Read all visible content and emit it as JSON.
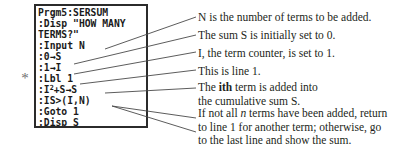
{
  "marker": {
    "symbol": "*"
  },
  "calculator": {
    "label": "ti-calculator-screen",
    "program_lines": [
      "Prgm5:SERSUM",
      ":Disp \"HOW MANY",
      "TERMS?\"",
      ":Input N",
      ":0→S",
      ":1→I",
      ":Lbl 1",
      ":I2+S→S",
      ":IS>(I,N)",
      ":Goto 1",
      ":Disp S"
    ],
    "line_8_base": ":I",
    "line_8_exponent": "2",
    "line_8_rest": "+S→S",
    "border_color": "#2b2b2b",
    "text_color": "#1a1a1a"
  },
  "annotations": [
    {
      "id": "n-terms-note",
      "lines": [
        [
          {
            "text": "N is the number of terms to be added.",
            "style": "normal"
          }
        ]
      ]
    },
    {
      "id": "sum-init-note",
      "lines": [
        [
          {
            "text": "The sum S is initially set to 0.",
            "style": "normal"
          }
        ]
      ]
    },
    {
      "id": "counter-init-note",
      "lines": [
        [
          {
            "text": "I, the term counter, is set to 1.",
            "style": "normal"
          }
        ]
      ]
    },
    {
      "id": "line-one-note",
      "lines": [
        [
          {
            "text": "This is line 1.",
            "style": "normal"
          }
        ]
      ]
    },
    {
      "id": "cumulative-sum-note",
      "lines": [
        [
          {
            "text": "The ",
            "style": "normal"
          },
          {
            "text": "ith",
            "style": "bold"
          },
          {
            "text": " term is added into",
            "style": "normal"
          }
        ],
        [
          {
            "text": "the cumulative sum S.",
            "style": "normal"
          }
        ]
      ]
    },
    {
      "id": "loop-control-note",
      "lines": [
        [
          {
            "text": "If not all ",
            "style": "normal"
          },
          {
            "text": "n",
            "style": "italic"
          },
          {
            "text": " terms have been added, return",
            "style": "normal"
          }
        ],
        [
          {
            "text": "to line 1 for another term; otherwise, go",
            "style": "normal"
          }
        ],
        [
          {
            "text": "to the last line and show the sum.",
            "style": "normal"
          }
        ]
      ]
    }
  ],
  "leaders": [
    {
      "name": "leader-to-input-n",
      "x1": 105,
      "y1": 49,
      "x2": 196,
      "y2": 17
    },
    {
      "name": "leader-to-zero-store-s",
      "x1": 74,
      "y1": 64,
      "x2": 196,
      "y2": 35
    },
    {
      "name": "leader-to-one-store-i",
      "x1": 74,
      "y1": 74,
      "x2": 196,
      "y2": 52
    },
    {
      "name": "leader-to-lbl-1",
      "x1": 80,
      "y1": 84,
      "x2": 196,
      "y2": 70
    },
    {
      "name": "leader-to-i-sq-plus-s",
      "x1": 105,
      "y1": 93,
      "x2": 196,
      "y2": 88
    },
    {
      "name": "leader-to-is-loop",
      "x1": 112,
      "y1": 106,
      "x2": 196,
      "y2": 118
    },
    {
      "name": "leader-to-goto-1",
      "x1": 112,
      "y1": 106,
      "x2": 196,
      "y2": 132
    }
  ],
  "colors": {
    "leader_stroke": "#4a4a4a",
    "text": "#231f20",
    "background": "#ffffff"
  }
}
